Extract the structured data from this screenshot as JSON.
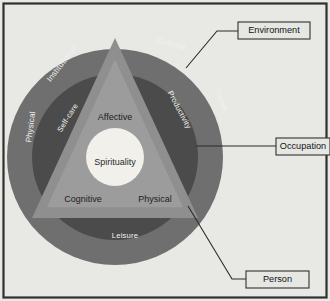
{
  "figure": {
    "background_color": "#e8e8e5",
    "frame_color": "#2f2f2f"
  },
  "rings": {
    "environment": {
      "name": "Environment",
      "color": "#6f6f6f",
      "labels": [
        {
          "text": "Institutional",
          "x": 62,
          "y": 64,
          "rotate": -52
        },
        {
          "text": "Cultural",
          "x": 171,
          "y": 44,
          "rotate": 14
        },
        {
          "text": "Social",
          "x": 221,
          "y": 100,
          "rotate": 66
        },
        {
          "text": "Physical",
          "x": 31,
          "y": 127,
          "rotate": -82
        }
      ]
    },
    "occupation": {
      "name": "Occupation",
      "color": "#4b4b4b",
      "labels": [
        {
          "text": "Self-care",
          "x": 68,
          "y": 118,
          "rotate": -58
        },
        {
          "text": "Productivity",
          "x": 179,
          "y": 110,
          "rotate": 62
        },
        {
          "text": "Leisure",
          "x": 125,
          "y": 236,
          "rotate": 0
        }
      ]
    },
    "person": {
      "name": "Person",
      "color": "#8f8f8f",
      "labels": [
        {
          "text": "Affective",
          "x": 115,
          "y": 118,
          "rotate": 0
        },
        {
          "text": "Cognitive",
          "x": 83,
          "y": 200,
          "rotate": 0
        },
        {
          "text": "Physical",
          "x": 155,
          "y": 200,
          "rotate": 0
        }
      ]
    },
    "core": {
      "name": "Spirituality",
      "color": "#f1f0ea",
      "label": {
        "text": "Spirituality",
        "x": 115,
        "y": 163
      }
    }
  },
  "callouts": [
    {
      "id": "environment",
      "label": "Environment",
      "box": {
        "x": 238,
        "y": 22,
        "w": 72,
        "h": 17
      },
      "line": [
        {
          "x": 238,
          "y": 31
        },
        {
          "x": 217,
          "y": 31
        },
        {
          "x": 186,
          "y": 68
        }
      ]
    },
    {
      "id": "occupation",
      "label": "Occupation",
      "box": {
        "x": 276,
        "y": 138,
        "w": 54,
        "h": 17
      },
      "line": [
        {
          "x": 276,
          "y": 146
        },
        {
          "x": 255,
          "y": 146
        },
        {
          "x": 196,
          "y": 146
        }
      ]
    },
    {
      "id": "person",
      "label": "Person",
      "box": {
        "x": 246,
        "y": 271,
        "w": 63,
        "h": 17
      },
      "line": [
        {
          "x": 246,
          "y": 279
        },
        {
          "x": 232,
          "y": 279
        },
        {
          "x": 188,
          "y": 206
        }
      ]
    }
  ],
  "geometry": {
    "center_x": 115,
    "center_y": 157,
    "outer_radius": 108,
    "middle_radius": 83,
    "core_radius": 29,
    "triangle_apex": {
      "x": 115,
      "y": 38
    },
    "triangle_left": {
      "x": 32,
      "y": 218
    },
    "triangle_right": {
      "x": 198,
      "y": 218
    }
  }
}
